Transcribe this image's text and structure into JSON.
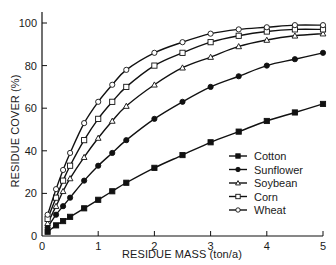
{
  "chart_data": {
    "type": "line",
    "title": "",
    "xlabel": "RESIDUE MASS (ton/a)",
    "ylabel": "RESIDUE COVER (%)",
    "xlim": [
      0,
      5
    ],
    "ylim": [
      0,
      100
    ],
    "xticks": [
      0,
      1,
      2,
      3,
      4,
      5
    ],
    "yticks": [
      0,
      20,
      40,
      60,
      80,
      100
    ],
    "grid": false,
    "legend_position": "lower right",
    "x": [
      0.1,
      0.25,
      0.375,
      0.5,
      0.75,
      1.0,
      1.25,
      1.5,
      2.0,
      2.5,
      3.0,
      3.5,
      4.0,
      4.5,
      5.0
    ],
    "series": [
      {
        "name": "Cotton",
        "marker": "filled-square",
        "values": [
          2,
          5,
          7,
          9,
          13,
          17,
          21,
          25,
          32,
          38,
          44,
          49,
          54,
          58,
          62
        ]
      },
      {
        "name": "Sunflower",
        "marker": "filled-circle",
        "values": [
          4,
          10,
          14,
          18,
          26,
          33,
          39,
          45,
          55,
          63,
          70,
          75,
          80,
          83,
          86
        ]
      },
      {
        "name": "Soybean",
        "marker": "open-triangle",
        "values": [
          6,
          14,
          21,
          27,
          37,
          46,
          54,
          61,
          71,
          79,
          84,
          89,
          92,
          94,
          95
        ]
      },
      {
        "name": "Corn",
        "marker": "open-square",
        "values": [
          8,
          18,
          26,
          33,
          45,
          55,
          63,
          70,
          80,
          86,
          91,
          94,
          96,
          97,
          97
        ]
      },
      {
        "name": "Wheat",
        "marker": "open-circle",
        "values": [
          10,
          22,
          31,
          39,
          53,
          63,
          71,
          78,
          86,
          91,
          95,
          97,
          98,
          99,
          99
        ]
      }
    ]
  },
  "colors": {
    "line": "#111111",
    "background": "#ffffff"
  }
}
